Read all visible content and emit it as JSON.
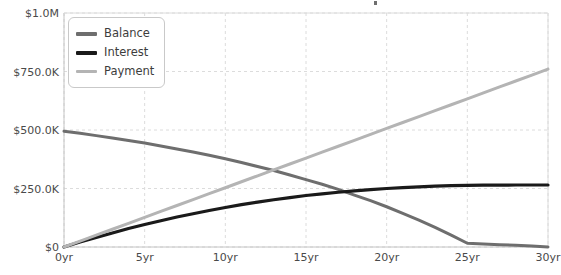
{
  "chart_data": {
    "type": "line",
    "title": "",
    "xlabel": "",
    "ylabel": "",
    "xlim": [
      0,
      30
    ],
    "ylim": [
      0,
      1000000
    ],
    "grid": true,
    "legend_position": "top-left",
    "x_tick_labels": [
      "0yr",
      "5yr",
      "10yr",
      "15yr",
      "20yr",
      "25yr",
      "30yr"
    ],
    "x_tick_values": [
      0,
      5,
      10,
      15,
      20,
      25,
      30
    ],
    "y_tick_labels": [
      "$0",
      "$250.0K",
      "$500.0K",
      "$750.0K",
      "$1.0M"
    ],
    "y_tick_values": [
      0,
      250000,
      500000,
      750000,
      1000000
    ],
    "x": [
      0,
      1,
      2,
      3,
      4,
      5,
      6,
      7,
      8,
      9,
      10,
      11,
      12,
      13,
      14,
      15,
      16,
      17,
      18,
      19,
      20,
      21,
      22,
      23,
      24,
      25,
      26,
      27,
      28,
      29,
      30
    ],
    "series": [
      {
        "name": "Balance",
        "color": "#6e6e6e",
        "values": [
          495000,
          486000,
          476000,
          466000,
          455000,
          444000,
          432000,
          419000,
          406000,
          392000,
          377000,
          361000,
          344000,
          327000,
          308000,
          288000,
          268000,
          246000,
          222000,
          198000,
          172000,
          144000,
          115000,
          84000,
          51000,
          16000,
          13000,
          10000,
          7000,
          4000,
          0
        ]
      },
      {
        "name": "Interest",
        "color": "#1a1a1a",
        "values": [
          0,
          21000,
          41000,
          60000,
          79000,
          96000,
          112000,
          128000,
          142000,
          156000,
          169000,
          181000,
          192000,
          202000,
          211000,
          220000,
          227000,
          234000,
          240000,
          245000,
          250000,
          254000,
          257000,
          260000,
          262000,
          263000,
          264000,
          264500,
          265000,
          265000,
          265000
        ]
      },
      {
        "name": "Payment",
        "color": "#b4b4b4",
        "values": [
          0,
          25300,
          50700,
          76000,
          101300,
          126700,
          152000,
          177300,
          202700,
          228000,
          253300,
          278700,
          304000,
          329300,
          354700,
          380000,
          405300,
          430700,
          456000,
          481300,
          506700,
          532000,
          557300,
          582700,
          608000,
          633300,
          658700,
          684000,
          709300,
          734700,
          760000
        ]
      }
    ]
  },
  "legend": {
    "items": [
      {
        "label": "Balance",
        "color": "#6e6e6e"
      },
      {
        "label": "Interest",
        "color": "#1a1a1a"
      },
      {
        "label": "Payment",
        "color": "#b4b4b4"
      }
    ]
  },
  "axes": {
    "grid_color": "#dcdcdc",
    "axis_color": "#c4c4c4",
    "tick_text_color": "#4a4a4a"
  }
}
